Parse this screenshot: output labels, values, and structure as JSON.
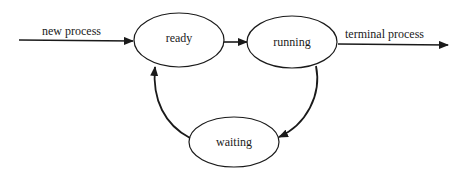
{
  "diagram": {
    "states": [
      {
        "id": "ready",
        "label": "ready"
      },
      {
        "id": "running",
        "label": "running"
      },
      {
        "id": "waiting",
        "label": "waiting"
      }
    ],
    "edges": [
      {
        "from": "start",
        "to": "ready",
        "label": "new process"
      },
      {
        "from": "ready",
        "to": "running",
        "label": ""
      },
      {
        "from": "running",
        "to": "end",
        "label": "terminal process"
      },
      {
        "from": "running",
        "to": "waiting",
        "label": ""
      },
      {
        "from": "waiting",
        "to": "ready",
        "label": ""
      }
    ],
    "colors": {
      "stroke": "#1a1a1a",
      "background": "#ffffff"
    }
  }
}
